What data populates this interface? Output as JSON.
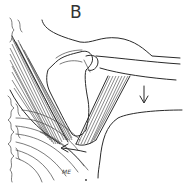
{
  "figure": {
    "panel_label": "B",
    "annotation": "ME",
    "arrows": [
      {
        "name": "down-arrow",
        "direction": "down"
      },
      {
        "name": "left-arrow",
        "direction": "left"
      }
    ]
  }
}
